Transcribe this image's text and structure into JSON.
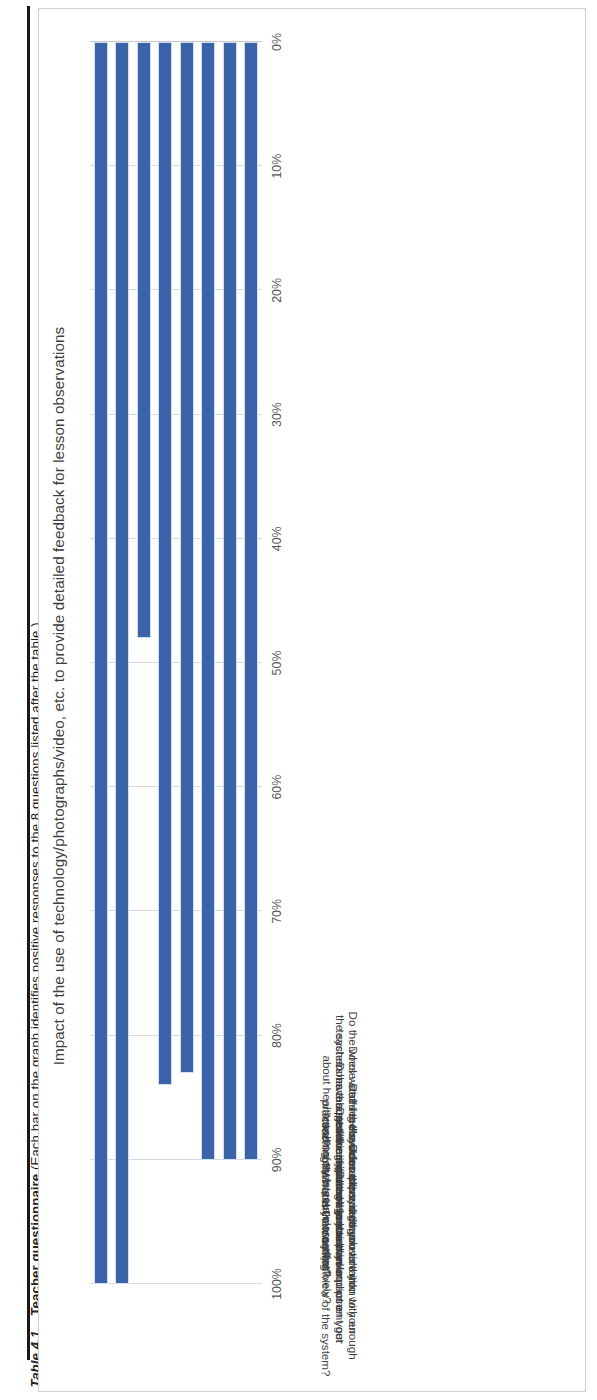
{
  "caption": {
    "number": "Table 4.1",
    "title": "Teacher questionnaire",
    "note": "(Each bar on the graph identifies positive responses to the 8 questions listed after the table.)",
    "full": "Table 4.1  Teacher questionnaire (Each bar on the graph identifies positive responses to the 8 questions listed after the table.)"
  },
  "chart_data": {
    "type": "bar",
    "orientation": "vertical-rotated",
    "title": "Impact of the use of technology/photographs/video, etc. to provide detailed feedback for lesson observations",
    "xlabel": "",
    "ylabel": "",
    "ylim": [
      0,
      100
    ],
    "grid": true,
    "legend": false,
    "tick_labels": [
      "100%",
      "90%",
      "80%",
      "70%",
      "60%",
      "50%",
      "40%",
      "30%",
      "20%",
      "10%",
      "0%"
    ],
    "tick_values": [
      100,
      90,
      80,
      70,
      60,
      50,
      40,
      30,
      20,
      10,
      0
    ],
    "bar_color": "#3b63a8",
    "categories": [
      "What is your overall view of the system?",
      "Does the system provide you with enough feedback to have an impact on your teaching?",
      "How disruptive is the observation to your teaching. (Does the observer/equipment get in the way?)",
      "Does the system help you plan and use teaching assistants more effectively?",
      "Does the system encourage you to think about the environment outside your classroom?",
      "Does the system encourage you to think about health and safety in your classroom?",
      "Does watching the video clips of other teachers have a positive impact on your own teaching?",
      "Do the whole-staff feedback sessions using the system have a positive impact on your practice?"
    ],
    "values": [
      100,
      100,
      48,
      84,
      83,
      90,
      90,
      90
    ]
  }
}
